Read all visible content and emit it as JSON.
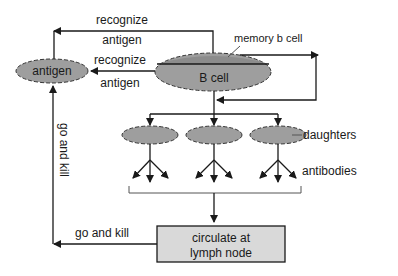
{
  "diagram": {
    "colors": {
      "ellipse_fill": "#9e9e9e",
      "memory_band_fill": "#8c8c8c",
      "box_fill": "#d9d9d9",
      "line": "#1a1a1a",
      "background": "#ffffff"
    },
    "nodes": {
      "antigen": "antigen",
      "b_cell": "B cell",
      "memory_b_cell": "memory b cell",
      "daughters": "daughters",
      "antibodies": "antibodies",
      "lymph_node_line1": "circulate at",
      "lymph_node_line2": "lymph node"
    },
    "edges": {
      "recognize_top_1": "recognize",
      "recognize_top_2": "antigen",
      "recognize_mid_1": "recognize",
      "recognize_mid_2": "antigen",
      "go_and_kill_bottom": "go and kill",
      "go_and_kill_vertical": "go and kill"
    }
  }
}
